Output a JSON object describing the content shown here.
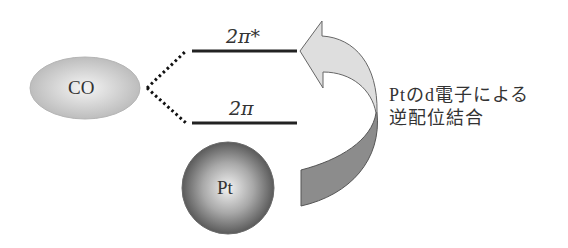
{
  "diagram": {
    "co_label": "CO",
    "pt_label": "Pt",
    "orbitals": [
      {
        "label": "2π*",
        "level": "upper"
      },
      {
        "label": "2π",
        "level": "lower"
      }
    ],
    "annotation": {
      "line1": "Ptのd電子による",
      "line2": "逆配位結合"
    },
    "colors": {
      "co_fill": "#c8c8c8",
      "pt_fill": "#777777",
      "arrow_head_fill": "#dcdcdc",
      "arrow_tail_fill": "#8a8a8a",
      "line": "#222222"
    }
  }
}
